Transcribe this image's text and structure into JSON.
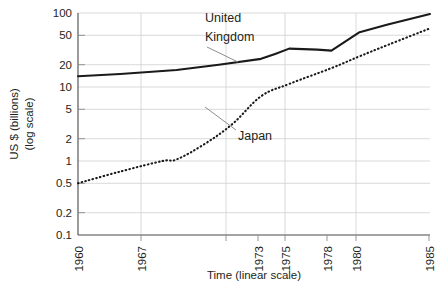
{
  "chart_data": {
    "type": "line",
    "title": "",
    "xlabel": "Time (linear scale)",
    "ylabel_line1": "US $ (billions)",
    "ylabel_line2": "(log scale)",
    "x_tick_labels": [
      "1960",
      "1967",
      "1973",
      "1975",
      "1978",
      "1980",
      "1985"
    ],
    "x_tick_values": [
      1960,
      1967,
      1973,
      1975,
      1978,
      1980,
      1985
    ],
    "xlim": [
      1960,
      1985
    ],
    "y_tick_labels": [
      "100",
      "50",
      "20",
      "10",
      "5",
      "2",
      "1",
      "0.5",
      "0.2",
      "0.1"
    ],
    "y_tick_values": [
      100,
      50,
      20,
      10,
      5,
      2,
      1,
      0.5,
      0.2,
      0.1
    ],
    "ylim": [
      0.1,
      100
    ],
    "yscale": "log",
    "grid": true,
    "legend_position": "inline-annotations",
    "series": [
      {
        "name": "United Kingdom",
        "style": "solid",
        "color": "#1a1a1a",
        "x": [
          1960,
          1963,
          1967,
          1970,
          1973,
          1974,
          1975,
          1977,
          1978,
          1980,
          1982,
          1985
        ],
        "values": [
          14,
          15,
          17,
          20,
          24,
          28,
          33,
          32,
          31,
          55,
          70,
          97
        ]
      },
      {
        "name": "Japan",
        "style": "dotted",
        "color": "#1a1a1a",
        "x": [
          1960,
          1963,
          1966,
          1967,
          1969,
          1971,
          1973,
          1975,
          1978,
          1980,
          1982,
          1985
        ],
        "values": [
          0.5,
          0.72,
          1.0,
          1.05,
          1.7,
          3.2,
          7.5,
          11,
          18,
          26,
          37,
          62
        ]
      }
    ],
    "annotations": [
      {
        "text_line1": "United",
        "text_line2": "Kingdom",
        "label_x": 205,
        "label_y": 20,
        "leader_from_x": 207,
        "leader_from_y": 47,
        "leader_to_x": 238,
        "leader_to_y": 62
      },
      {
        "text": "Japan",
        "label_x": 238,
        "label_y": 135,
        "leader_from_x": 236,
        "leader_from_y": 130,
        "leader_to_x": 205,
        "leader_to_y": 107
      }
    ]
  },
  "geometry": {
    "plot_left": 78,
    "plot_right": 430,
    "plot_top": 13,
    "plot_bottom": 235
  }
}
